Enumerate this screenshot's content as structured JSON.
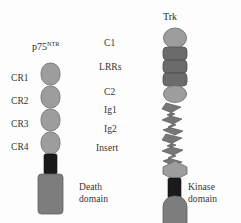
{
  "figure": {
    "background_color": "#fdfdfd",
    "text_color": "#333333",
    "receptors": [
      {
        "id": "p75",
        "title": "p75",
        "title_superscript": "NTR",
        "domain_labels": [
          "CR1",
          "CR2",
          "CR3",
          "CR4"
        ],
        "intracellular_label_line1": "Death",
        "intracellular_label_line2": "domain",
        "colors": {
          "cr_domain": "#9d9d9d",
          "transmembrane": "#1a1a1a",
          "death_domain": "#7d7d7d",
          "outline": "#6a6a6a"
        },
        "shapes": [
          {
            "name": "cr1-domain",
            "type": "rounded-oval",
            "fill": "#9d9d9d"
          },
          {
            "name": "cr2-domain",
            "type": "rounded-oval",
            "fill": "#9d9d9d"
          },
          {
            "name": "cr3-domain",
            "type": "rounded-oval",
            "fill": "#9d9d9d"
          },
          {
            "name": "cr4-domain",
            "type": "rounded-oval",
            "fill": "#9d9d9d"
          },
          {
            "name": "transmembrane-segment",
            "type": "bar",
            "fill": "#1a1a1a"
          },
          {
            "name": "death-domain",
            "type": "rounded-rect",
            "fill": "#7d7d7d"
          }
        ]
      },
      {
        "id": "trk",
        "title": "Trk",
        "title_superscript": "",
        "domain_labels": [
          "C1",
          "LRRs",
          "C2",
          "Ig1",
          "Ig2",
          "Insert"
        ],
        "intracellular_label_line1": "Kinase",
        "intracellular_label_line2": "domain",
        "colors": {
          "c_domain": "#9d9d9d",
          "lrr_domain": "#6b6b6b",
          "ig_domain": "#767676",
          "insert_domain": "#9d9d9d",
          "transmembrane": "#1a1a1a",
          "kinase_domain": "#7d7d7d",
          "outline": "#5e5e5e"
        },
        "shapes": [
          {
            "name": "c1-domain",
            "type": "ellipse",
            "fill": "#9d9d9d"
          },
          {
            "name": "lrr-disc-1",
            "type": "disc",
            "fill": "#6b6b6b"
          },
          {
            "name": "lrr-disc-2",
            "type": "disc",
            "fill": "#6b6b6b"
          },
          {
            "name": "lrr-disc-3",
            "type": "disc",
            "fill": "#6b6b6b"
          },
          {
            "name": "c2-domain",
            "type": "ellipse",
            "fill": "#9d9d9d"
          },
          {
            "name": "ig1-domain",
            "type": "zigzag",
            "fill": "#767676"
          },
          {
            "name": "ig2-domain",
            "type": "zigzag",
            "fill": "#767676"
          },
          {
            "name": "insert-domain",
            "type": "hexagon",
            "fill": "#9d9d9d"
          },
          {
            "name": "transmembrane-segment",
            "type": "bar",
            "fill": "#1a1a1a"
          },
          {
            "name": "kinase-domain",
            "type": "rounded-rect",
            "fill": "#7d7d7d"
          }
        ]
      }
    ]
  }
}
